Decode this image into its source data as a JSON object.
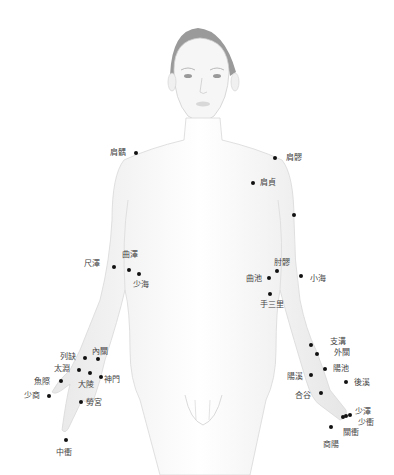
{
  "diagram": {
    "point_color": "#111111",
    "label_color": "#444444",
    "points": [
      {
        "id": "jianyu-left",
        "label": "肩髃",
        "side": "right-arm"
      },
      {
        "id": "jianyu-right",
        "label": "肩髎",
        "side": "left-arm"
      },
      {
        "id": "jianzhen",
        "label": "肩貞",
        "side": "left-arm"
      },
      {
        "id": "upper-arm-point",
        "label": "",
        "side": "left-arm"
      },
      {
        "id": "chize",
        "label": "尺澤",
        "side": "right-arm"
      },
      {
        "id": "quze",
        "label": "曲澤",
        "side": "right-arm"
      },
      {
        "id": "shaohai",
        "label": "少海",
        "side": "right-arm"
      },
      {
        "id": "zhouliao",
        "label": "肘髎",
        "side": "left-arm"
      },
      {
        "id": "quchi",
        "label": "曲池",
        "side": "left-arm"
      },
      {
        "id": "xiaohai",
        "label": "小海",
        "side": "left-arm"
      },
      {
        "id": "shousanli",
        "label": "手三里",
        "side": "left-arm"
      },
      {
        "id": "lieque",
        "label": "列缺",
        "side": "right-hand"
      },
      {
        "id": "neiguan",
        "label": "內關",
        "side": "right-hand"
      },
      {
        "id": "taiyuan",
        "label": "太淵",
        "side": "right-hand"
      },
      {
        "id": "daling",
        "label": "大陵",
        "side": "right-hand"
      },
      {
        "id": "shenmen",
        "label": "神門",
        "side": "right-hand"
      },
      {
        "id": "yuji",
        "label": "魚際",
        "side": "right-hand"
      },
      {
        "id": "shaoshang",
        "label": "少商",
        "side": "right-hand"
      },
      {
        "id": "laogong",
        "label": "勞宮",
        "side": "right-hand"
      },
      {
        "id": "zhongchong",
        "label": "中衝",
        "side": "right-hand"
      },
      {
        "id": "zhigou",
        "label": "支溝",
        "side": "left-hand"
      },
      {
        "id": "waiguan",
        "label": "外關",
        "side": "left-hand"
      },
      {
        "id": "yangchi",
        "label": "陽池",
        "side": "left-hand"
      },
      {
        "id": "yangxi",
        "label": "陽溪",
        "side": "left-hand"
      },
      {
        "id": "houxi",
        "label": "後溪",
        "side": "left-hand"
      },
      {
        "id": "hegu",
        "label": "合谷",
        "side": "left-hand"
      },
      {
        "id": "shaoze",
        "label": "少澤",
        "side": "left-hand"
      },
      {
        "id": "shaochong",
        "label": "少衝",
        "side": "left-hand"
      },
      {
        "id": "guanchong",
        "label": "關衝",
        "side": "left-hand"
      },
      {
        "id": "shangyang",
        "label": "商陽",
        "side": "left-hand"
      }
    ]
  }
}
